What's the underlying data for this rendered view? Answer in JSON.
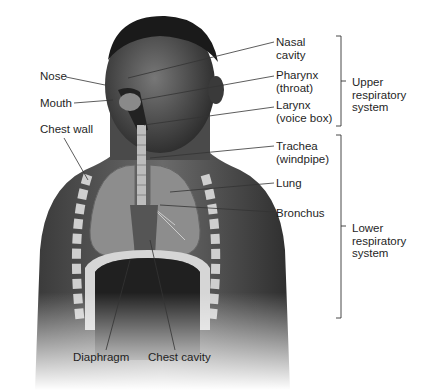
{
  "figure": {
    "left_labels": {
      "nose": "Nose",
      "mouth": "Mouth",
      "chest_wall": "Chest wall"
    },
    "right_labels": {
      "nasal_cavity": "Nasal\ncavity",
      "pharynx": "Pharynx\n(throat)",
      "larynx": "Larynx\n(voice box)",
      "trachea": "Trachea\n(windpipe)",
      "lung": "Lung",
      "bronchus": "Bronchus"
    },
    "bottom_labels": {
      "diaphragm": "Diaphragm",
      "chest_cavity": "Chest cavity"
    },
    "groups": {
      "upper": "Upper\nrespiratory\nsystem",
      "lower": "Lower\nrespiratory\nsystem"
    }
  }
}
